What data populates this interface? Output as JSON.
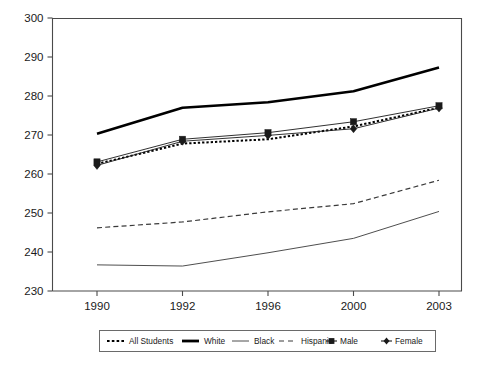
{
  "chart_data": {
    "type": "line",
    "title": "",
    "subtitle": "",
    "xlabel": "",
    "ylabel": "",
    "x": [
      "1990",
      "1992",
      "1996",
      "2000",
      "2003"
    ],
    "categories": [
      "1990",
      "1992",
      "1996",
      "2000",
      "2003"
    ],
    "xtick_labels": [
      "1990",
      "1992",
      "1996",
      "2000",
      "2003"
    ],
    "ytick_labels": [
      "230",
      "240",
      "250",
      "260",
      "270",
      "280",
      "290",
      "300"
    ],
    "ytick_values": [
      230,
      240,
      250,
      260,
      270,
      280,
      290,
      300
    ],
    "ylim": [
      230,
      300
    ],
    "grid": false,
    "legend_position": "bottom",
    "series": [
      {
        "name": "All Students",
        "style": "dotted",
        "color": "#000000",
        "width": 2.0,
        "marker": "none",
        "values": [
          262.6,
          267.8,
          268.9,
          272.2,
          277.0
        ]
      },
      {
        "name": "White",
        "style": "solid",
        "color": "#000000",
        "width": 2.6,
        "marker": "none",
        "values": [
          270.3,
          277.0,
          278.4,
          281.2,
          287.3
        ]
      },
      {
        "name": "Black",
        "style": "solid",
        "color": "#3a3a3a",
        "width": 0.9,
        "marker": "none",
        "values": [
          236.7,
          236.4,
          239.8,
          243.5,
          250.4
        ]
      },
      {
        "name": "Hispanic",
        "style": "dashed",
        "color": "#3a3a3a",
        "width": 1.2,
        "marker": "none",
        "values": [
          246.2,
          247.7,
          250.3,
          252.4,
          258.4
        ]
      },
      {
        "name": "Male",
        "style": "solid",
        "color": "#1a1a1a",
        "width": 0.9,
        "marker": "square",
        "values": [
          263.1,
          268.9,
          270.6,
          273.4,
          277.5
        ]
      },
      {
        "name": "Female",
        "style": "solid",
        "color": "#1a1a1a",
        "width": 0.9,
        "marker": "diamond",
        "values": [
          262.2,
          268.4,
          269.9,
          271.6,
          276.9
        ]
      }
    ]
  },
  "legend": {
    "entries": [
      {
        "label": "All Students",
        "swatch": "dotted-thick"
      },
      {
        "label": "White",
        "swatch": "solid-thick"
      },
      {
        "label": "Black",
        "swatch": "solid-thin"
      },
      {
        "label": "Hispanic",
        "swatch": "dashed-thin"
      },
      {
        "label": "Male",
        "swatch": "line-square-marker"
      },
      {
        "label": "Female",
        "swatch": "line-diamond-marker"
      }
    ]
  }
}
